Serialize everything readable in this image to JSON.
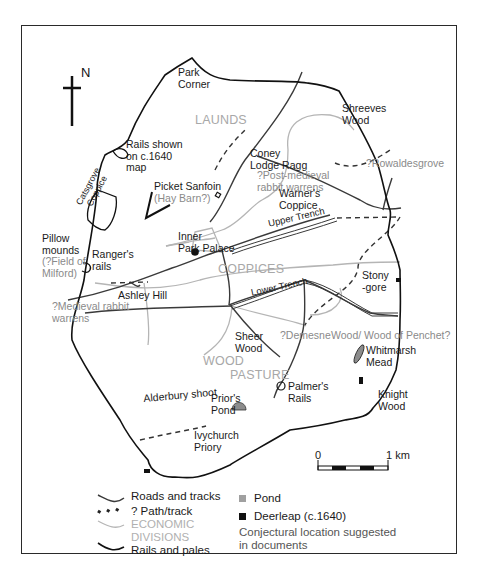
{
  "map": {
    "north_label": "N",
    "divisions": {
      "launds": "LAUNDS",
      "coppices": "COPPICES",
      "wood": "WOOD",
      "pasture": "PASTURE"
    },
    "places": {
      "park_corner_1": "Park",
      "park_corner_2": "Corner",
      "shreeves_1": "Shreeves",
      "shreeves_2": "Wood",
      "rails_shown_1": "Rails shown",
      "rails_shown_2": "on c.1640",
      "rails_shown_3": "map",
      "catsgrove_1": "Catsgrove",
      "catsgrove_2": "Coppice",
      "coney_1": "Coney",
      "coney_2": "Lodge Ragg",
      "post_medieval_1": "?Post-medieval",
      "post_medieval_2": "rabbit warrens",
      "rowaldesgrove": "?Rowaldesgrove",
      "warners_1": "Warner's",
      "warners_2": "Coppice",
      "picket_1": "Picket Sanfoin",
      "picket_2": "(Hay Barn?)",
      "pillow_1": "Pillow",
      "pillow_2": "mounds",
      "pillow_3": "(?Field of",
      "pillow_4": "Milford)",
      "rangers_1": "Ranger's",
      "rangers_2": "rails",
      "inner_1": "Inner",
      "inner_2": "Park Palace",
      "upper_trench": "Upper Trench",
      "lower_trench": "Lower Trench",
      "stony_1": "Stony",
      "stony_2": "-gore",
      "ashley_hill": "Ashley Hill",
      "medieval_1": "?Medieval rabbit",
      "medieval_2": "warrens",
      "sheer_1": "Sheer",
      "sheer_2": "Wood",
      "demesne": "?Demesne",
      "penchet": "Wood/ Wood of Penchet?",
      "whitmarsh_1": "Whitmarsh",
      "whitmarsh_2": "Mead",
      "alderbury": "Alderbury shoot",
      "priors_1": "Prior's",
      "priors_2": "Pond",
      "palmers_1": "Palmer's",
      "palmers_2": "Rails",
      "knight_1": "Knight",
      "knight_2": "Wood",
      "ivychurch_1": "Ivychurch",
      "ivychurch_2": "Priory"
    },
    "scale": {
      "start": "0",
      "end": "1 km"
    }
  },
  "legend": {
    "roads": "Roads and tracks",
    "path": "? Path/track",
    "econ_1": "ECONOMIC",
    "econ_2": "DIVISIONS",
    "rails": "Rails and pales",
    "pond": "Pond",
    "deerleap": "Deerleap (c.1640)",
    "conj_1": "Conjectural location suggested",
    "conj_2": "in documents"
  },
  "colors": {
    "road": "#3a3a3a",
    "rail": "#111111",
    "division": "#b5b5b5",
    "pond": "#8c8c8c",
    "deerleap": "#111111"
  }
}
